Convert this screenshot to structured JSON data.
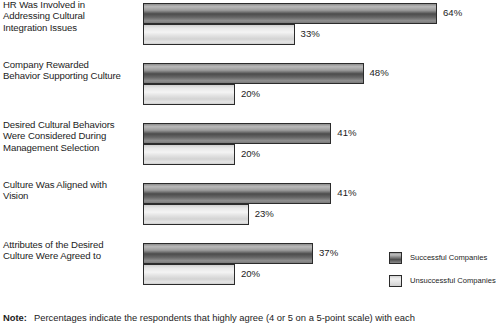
{
  "chart_data": {
    "type": "bar",
    "orientation": "horizontal",
    "title": "",
    "subtitle": "",
    "xlabel": "",
    "ylabel": "",
    "xlim": [
      0,
      70
    ],
    "grid": false,
    "legend_position": "bottom-right",
    "value_suffix": "%",
    "categories": [
      "HR Was Involved in Addressing Cultural Integration Issues",
      "Company Rewarded Behavior Supporting Culture",
      "Desired Cultural Behaviors Were Considered During Management Selection",
      "Culture Was Aligned with Vision",
      "Attributes of the Desired Culture Were Agreed to"
    ],
    "category_lines": [
      [
        "HR Was Involved in",
        "Addressing Cultural",
        "Integration Issues"
      ],
      [
        "Company Rewarded",
        "Behavior Supporting Culture"
      ],
      [
        "Desired Cultural Behaviors",
        "Were Considered During",
        "Management Selection"
      ],
      [
        "Culture Was Aligned with",
        "Vision"
      ],
      [
        "Attributes of the Desired",
        "Culture Were Agreed to"
      ]
    ],
    "series": [
      {
        "name": "Successful Companies",
        "color": "#6a6a6a",
        "values": [
          64,
          48,
          41,
          41,
          37
        ],
        "labels": [
          "64%",
          "48%",
          "41%",
          "41%",
          "37%"
        ]
      },
      {
        "name": "Unsuccessful Companies",
        "color": "#e6e6e6",
        "values": [
          33,
          20,
          20,
          23,
          20
        ],
        "labels": [
          "33%",
          "20%",
          "20%",
          "23%",
          "20%"
        ]
      }
    ]
  },
  "legend": {
    "items": [
      {
        "label": "Successful Companies",
        "swatch": "successful"
      },
      {
        "label": "Unsuccessful Companies",
        "swatch": "unsuccessful"
      }
    ]
  },
  "note": {
    "label": "Note:",
    "text": "Percentages indicate the respondents that highly agree (4 or 5 on a 5-point scale) with each"
  }
}
